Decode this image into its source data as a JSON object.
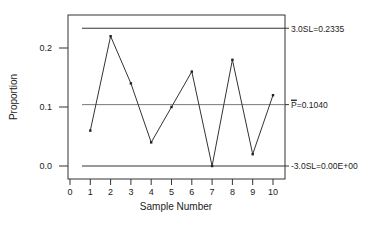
{
  "chart_data": {
    "type": "line",
    "title": "",
    "xlabel": "Sample Number",
    "ylabel": "Proportion",
    "x": [
      1,
      2,
      3,
      4,
      5,
      6,
      7,
      8,
      9,
      10
    ],
    "series": [
      {
        "name": "Proportion",
        "values": [
          0.06,
          0.22,
          0.14,
          0.04,
          0.1,
          0.16,
          0.0,
          0.18,
          0.02,
          0.12
        ]
      }
    ],
    "x_ticks": [
      "0",
      "1",
      "2",
      "3",
      "4",
      "5",
      "6",
      "7",
      "8",
      "9",
      "10"
    ],
    "y_ticks": [
      "0.0",
      "0.1",
      "0.2"
    ],
    "xlim": [
      0,
      10
    ],
    "ylim": [
      -0.02,
      0.255
    ],
    "grid": false,
    "legend": null,
    "reference_lines": [
      {
        "name": "UCL",
        "value": 0.2335,
        "label": "3.0SL=0.2335"
      },
      {
        "name": "Center",
        "value": 0.104,
        "label": "P=0.1040"
      },
      {
        "name": "LCL",
        "value": 0.0,
        "label": "-3.0SL=0.00E+00"
      }
    ]
  },
  "labels": {
    "ucl": "3.0SL=0.2335",
    "center_bar": "P",
    "center_rest": "=0.1040",
    "lcl": "-3.0SL=0.00E+00",
    "xlabel": "Sample Number",
    "ylabel": "Proportion"
  }
}
